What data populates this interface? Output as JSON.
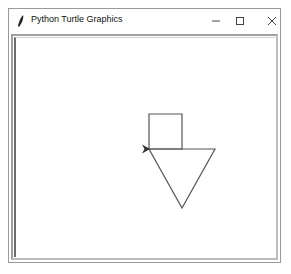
{
  "window": {
    "title": "Python Turtle Graphics",
    "icon": "feather-icon",
    "controls": {
      "minimize": "—",
      "maximize": "☐",
      "close": "✕"
    }
  },
  "canvas": {
    "background": "#ffffff",
    "stroke_color": "#555555",
    "shapes": [
      {
        "type": "square",
        "points": [
          [
            149,
            114
          ],
          [
            182,
            114
          ],
          [
            182,
            149
          ],
          [
            149,
            149
          ]
        ]
      },
      {
        "type": "triangle",
        "points": [
          [
            149,
            149
          ],
          [
            215,
            149
          ],
          [
            182,
            208
          ]
        ]
      }
    ],
    "turtle": {
      "x": 149,
      "y": 149,
      "heading": "right",
      "color": "#444444"
    }
  }
}
